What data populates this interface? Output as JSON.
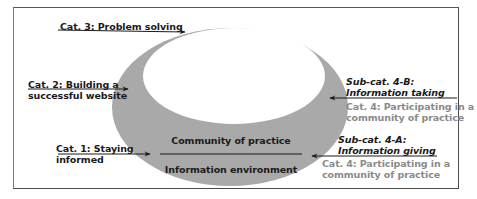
{
  "diagram": {
    "colors": {
      "ring": "#a9a9a9",
      "inner": "#ffffff",
      "text": "#1a1a1a",
      "secondary_text": "#8a8a8a",
      "border": "#4a4a4a"
    },
    "ring_labels": {
      "top": "Community of practice",
      "bottom": "Information environment"
    },
    "left_categories": [
      {
        "line1": "Cat. 3: Problem solving",
        "line2": ""
      },
      {
        "line1": "Cat. 2: Building a",
        "line2": "successful website"
      },
      {
        "line1": "Cat. 1: Staying",
        "line2": "informed"
      }
    ],
    "right_categories": [
      {
        "sub_line1": "Sub-cat. 4-B:",
        "sub_line2": "Information taking",
        "cat_line1": "Cat. 4: Participating in a",
        "cat_line2": "community of practice"
      },
      {
        "sub_line1": "Sub-cat. 4-A:",
        "sub_line2": "Information giving",
        "cat_line1": "Cat. 4: Participating in a",
        "cat_line2": "community of practice"
      }
    ]
  }
}
